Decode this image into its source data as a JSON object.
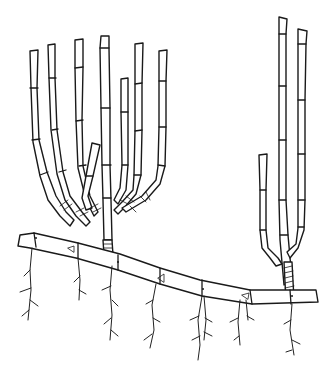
{
  "illustration": {
    "subject": "bamboo rhizome with culms",
    "description": "Black-and-white line drawing of a horizontal segmented bamboo rhizome with roots, bearing a left cluster of branching culms and a right cluster of tall culms",
    "colors": {
      "ink": "#1a1a1a",
      "background": "#ffffff"
    },
    "left_cluster": {
      "culm_count": 8
    },
    "right_cluster": {
      "culm_count": 3
    },
    "rhizome": {
      "segment_count": 8
    },
    "root_count": 8
  }
}
